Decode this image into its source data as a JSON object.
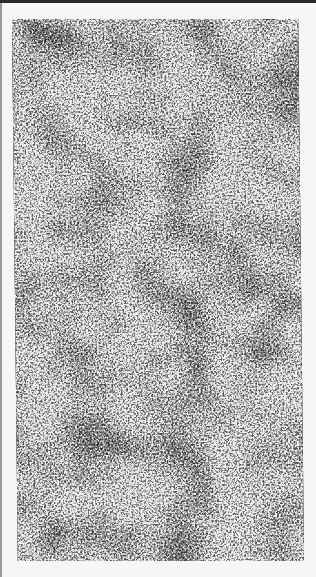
{
  "page": {
    "background": "#f6f6f6"
  },
  "figure": {
    "colors": {
      "dark": "#141414",
      "light": "#f0f0f0"
    }
  },
  "rules": {
    "top_color": "#2a2a2a",
    "left_color": "#9a9a9a"
  }
}
